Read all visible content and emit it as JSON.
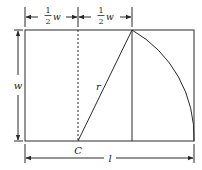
{
  "diagram": {
    "type": "geometric construction (golden rectangle)",
    "labels": {
      "half_w_left_num": "1",
      "half_w_left_den": "2",
      "half_w_left_var": "w",
      "half_w_right_num": "1",
      "half_w_right_den": "2",
      "half_w_right_var": "w",
      "height": "w",
      "radius": "r",
      "center": "C",
      "length": "l"
    },
    "colors": {
      "line": "#2a2a2a",
      "background": "#ffffff"
    }
  }
}
